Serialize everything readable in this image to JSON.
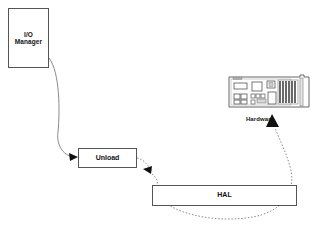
{
  "diagram": {
    "background_color": "#ffffff",
    "line_color": "#8a8a8a",
    "box_border_color": "#555555",
    "text_color": "#111111",
    "nodes": [
      {
        "id": "io-manager",
        "label_line1": "I/O",
        "label_line2": "Manager",
        "shape": "rectangle",
        "x": 8,
        "y": 8,
        "width": 41,
        "height": 60
      },
      {
        "id": "unload",
        "label": "Unload",
        "shape": "rectangle",
        "x": 78,
        "y": 148,
        "width": 59,
        "height": 20
      },
      {
        "id": "hal",
        "label": "HAL",
        "shape": "rectangle",
        "x": 152,
        "y": 185,
        "width": 145,
        "height": 21
      }
    ],
    "hardware": {
      "label": "Hardware",
      "icon": "circuit-board-icon",
      "x": 228,
      "y": 74,
      "width": 84,
      "height": 52
    },
    "connectors": [
      {
        "id": "io-manager-to-unload",
        "from": "io-manager",
        "to": "unload",
        "style": "solid",
        "arrowhead": "filled-triangle",
        "label": ""
      },
      {
        "id": "unload-to-hal",
        "from": "unload",
        "to": "hal",
        "style": "dotted",
        "arrowhead": "filled-triangle",
        "label": ""
      },
      {
        "id": "hal-to-hardware",
        "from": "hal",
        "to": "hardware",
        "style": "dotted",
        "arrowhead": "filled-triangle",
        "label": ""
      }
    ]
  }
}
